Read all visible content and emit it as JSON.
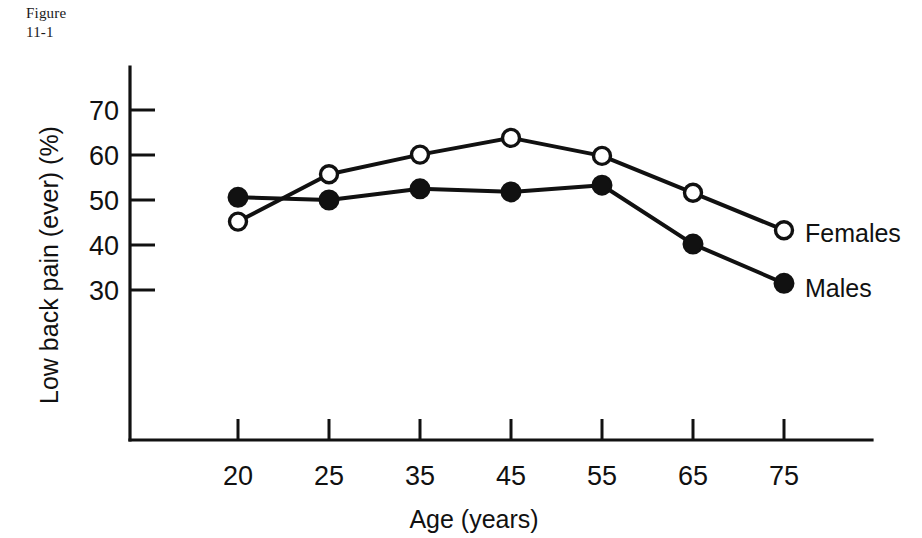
{
  "figure": {
    "caption": "Figure\n11-1"
  },
  "chart_data": {
    "type": "line",
    "title": "",
    "xlabel": "Age (years)",
    "ylabel": "Low back pain (ever) (%)",
    "categories": [
      "20",
      "25",
      "35",
      "45",
      "55",
      "65",
      "75"
    ],
    "x": [
      20,
      25,
      35,
      45,
      55,
      65,
      75
    ],
    "xticklabels": [
      "20",
      "25",
      "35",
      "45",
      "55",
      "65",
      "75"
    ],
    "yticklabels": [
      "30",
      "40",
      "50",
      "60",
      "70"
    ],
    "yticks": [
      30,
      40,
      50,
      60,
      70
    ],
    "ylim": [
      18,
      78
    ],
    "grid": false,
    "legend_position": "right-of-line-ends",
    "series": [
      {
        "name": "Females",
        "marker": "open-circle",
        "values": [
          45.2,
          55.7,
          60.1,
          63.8,
          59.8,
          51.6,
          43.3
        ]
      },
      {
        "name": "Males",
        "marker": "filled-circle",
        "values": [
          50.6,
          50.0,
          52.5,
          51.8,
          53.3,
          40.2,
          31.5
        ]
      }
    ],
    "colors": {
      "ink": "#111111",
      "background": "#ffffff"
    }
  }
}
